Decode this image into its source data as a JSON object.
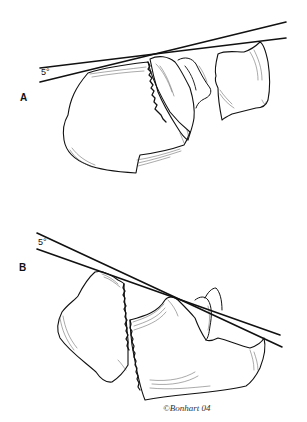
{
  "figure": {
    "panels": [
      {
        "id": "A",
        "label": "A",
        "angle_label": "5°"
      },
      {
        "id": "B",
        "label": "B",
        "angle_label": "5°"
      }
    ],
    "signature": "©Bonhart 04",
    "colors": {
      "ink": "#111111",
      "background": "#ffffff",
      "hatch": "#555555"
    }
  }
}
